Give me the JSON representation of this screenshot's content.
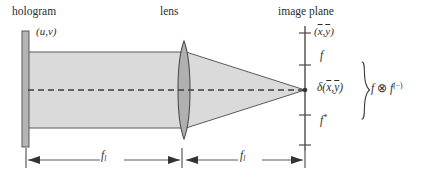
{
  "figure": {
    "kind": "optical-diagram",
    "title_labels": {
      "hologram": "hologram",
      "lens": "lens",
      "image_plane": "image plane"
    },
    "coordinate_labels": {
      "input_plane": "(u,v)",
      "output_plane_x": "x",
      "output_plane_y": "y",
      "output_plane_full": "(x̄,ȳ)"
    },
    "axis_ticks": {
      "top_label": "f",
      "center_label_delta": "δ(",
      "center_label_delta_x": "x",
      "center_label_delta_y": "y",
      "center_label_delta_close": ")",
      "bottom_label_base": "f",
      "bottom_label_sup": "*"
    },
    "annotation": {
      "brace": "}",
      "expr_f1": "f",
      "expr_op": "⊗",
      "expr_f2": "f",
      "expr_sup": "(−)"
    },
    "dimensions": [
      {
        "base": "f",
        "subscript": "l"
      },
      {
        "base": "f",
        "subscript": "l"
      }
    ],
    "colors": {
      "beam_fill": "#d9d9d9",
      "beam_stroke": "#4a4a4a",
      "lens_fill": "#b0b0b0",
      "lens_stroke": "#555555",
      "plate_fill": "#b4b4b4",
      "plate_stroke": "#5a5a5a",
      "axis_stroke": "#4a4a4a",
      "dash_stroke": "#3d3d3d",
      "background": "#ffffff",
      "text": "#2e2e2e"
    },
    "geometry": {
      "hologram_x": 24,
      "lens_x": 182,
      "image_plane_x": 305,
      "optical_axis_y": 90,
      "beam_half_height": 38
    }
  }
}
